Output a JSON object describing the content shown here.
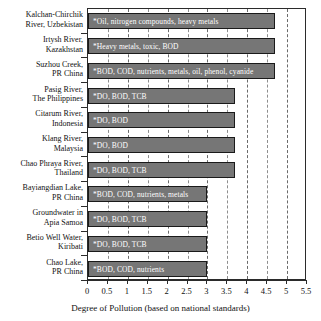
{
  "chart_data": {
    "type": "bar",
    "orientation": "horizontal",
    "title": "",
    "xlabel": "Degree of Pollution (based on national standards)",
    "ylabel": "",
    "xlim": [
      0,
      5.5
    ],
    "xticks": [
      "0",
      "0.5",
      "1",
      "1.5",
      "2",
      "2.5",
      "3",
      "3.5",
      "4",
      "4.5",
      "5",
      "5.5"
    ],
    "xtick_values": [
      0,
      0.5,
      1,
      1.5,
      2,
      2.5,
      3,
      3.5,
      4,
      4.5,
      5,
      5.5
    ],
    "grid": "vertical-dashed",
    "legend": "none",
    "bar_color": "#767676",
    "bar_edge_color": "#1a1a1a",
    "categories": [
      "Kalchan-Chirchik River, Uzbekistan",
      "Irtysh River, Kazakhstan",
      "Suzhou Creek, PR China",
      "Pasig River, The Philippines",
      "Citarum River, Indonesia",
      "Klang River, Malaysia",
      "Chao Phraya River, Thailand",
      "Bayiangdian Lake, PR China",
      "Groundwater in Apia Samoa",
      "Betio Well Water, Kiribati",
      "Chao Lake, PR China"
    ],
    "values": [
      4.7,
      4.7,
      4.7,
      3.7,
      3.7,
      3.7,
      3.7,
      3.0,
      3.0,
      3.0,
      3.0
    ],
    "point_labels": [
      "*Oil, nitrogen compounds, heavy metals",
      "*Heavy metals, toxic, BOD",
      "*BOD, COD, nutrients, metals, oil, phenol, cyanide",
      "*DO, BOD, TCB",
      "*DO, BOD",
      "*DO, BOD",
      "*DO, BOD, TCB",
      "*BOD, COD, nutrients, metals",
      "*DO, BOD, TCB",
      "*DO, BOD, TCB",
      "*BOD, COD, nutrients"
    ]
  },
  "y_labels": [
    {
      "line1": "Kalchan-Chirchik",
      "line2": "River, Uzbekistan"
    },
    {
      "line1": "Irtysh River,",
      "line2": "Kazakhstan"
    },
    {
      "line1": "Suzhou Creek,",
      "line2": "PR China"
    },
    {
      "line1": "Pasig River,",
      "line2": "The Philippines"
    },
    {
      "line1": "Citarum River,",
      "line2": "Indonesia"
    },
    {
      "line1": "Klang River,",
      "line2": "Malaysia"
    },
    {
      "line1": "Chao Phraya River,",
      "line2": "Thailand"
    },
    {
      "line1": "Bayiangdian Lake,",
      "line2": "PR China"
    },
    {
      "line1": "Groundwater in",
      "line2": "Apia Samoa"
    },
    {
      "line1": "Betio Well Water,",
      "line2": "Kiribati"
    },
    {
      "line1": "Chao Lake,",
      "line2": "PR China"
    }
  ]
}
